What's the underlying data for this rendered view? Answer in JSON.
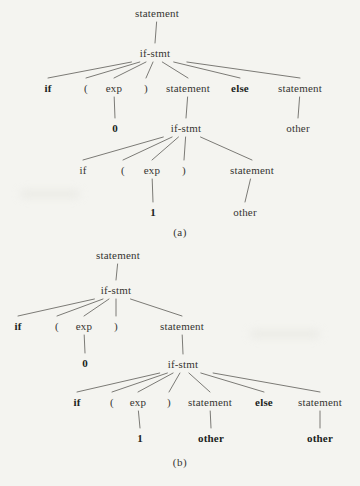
{
  "colors": {
    "background": "#f4f4f0",
    "text": "#363532",
    "bold_text": "#201f1d",
    "edge_line": "#6d6c68"
  },
  "tree_a": {
    "caption": "(a)",
    "caption_pos": {
      "x": 180,
      "y": 232
    },
    "nodes": [
      {
        "id": "statement-root",
        "label": "statement",
        "x": 157,
        "y": 13,
        "bold": false
      },
      {
        "id": "ifstmt-1",
        "label": "if-stmt",
        "x": 155,
        "y": 53,
        "bold": false
      },
      {
        "id": "if-1",
        "label": "if",
        "x": 48,
        "y": 88,
        "bold": true
      },
      {
        "id": "lparen-1",
        "label": "(",
        "x": 86,
        "y": 88,
        "bold": false
      },
      {
        "id": "exp-1",
        "label": "exp",
        "x": 114,
        "y": 88,
        "bold": false
      },
      {
        "id": "rparen-1",
        "label": ")",
        "x": 146,
        "y": 88,
        "bold": false
      },
      {
        "id": "statement-1",
        "label": "statement",
        "x": 188,
        "y": 88,
        "bold": false
      },
      {
        "id": "else-1",
        "label": "else",
        "x": 240,
        "y": 88,
        "bold": true
      },
      {
        "id": "statement-2",
        "label": "statement",
        "x": 300,
        "y": 88,
        "bold": false
      },
      {
        "id": "zero",
        "label": "0",
        "x": 115,
        "y": 128,
        "bold": true
      },
      {
        "id": "ifstmt-2",
        "label": "if-stmt",
        "x": 186,
        "y": 128,
        "bold": false
      },
      {
        "id": "other-1",
        "label": "other",
        "x": 298,
        "y": 128,
        "bold": false
      },
      {
        "id": "if-2",
        "label": "if",
        "x": 83,
        "y": 170,
        "bold": false
      },
      {
        "id": "lparen-2",
        "label": "(",
        "x": 123,
        "y": 170,
        "bold": false
      },
      {
        "id": "exp-2",
        "label": "exp",
        "x": 152,
        "y": 170,
        "bold": false
      },
      {
        "id": "rparen-2",
        "label": ")",
        "x": 184,
        "y": 170,
        "bold": false
      },
      {
        "id": "statement-3",
        "label": "statement",
        "x": 252,
        "y": 170,
        "bold": false
      },
      {
        "id": "one",
        "label": "1",
        "x": 153,
        "y": 212,
        "bold": true
      },
      {
        "id": "other-2",
        "label": "other",
        "x": 245,
        "y": 212,
        "bold": false
      }
    ],
    "edges": [
      [
        "statement-root",
        "ifstmt-1"
      ],
      [
        "ifstmt-1",
        "if-1"
      ],
      [
        "ifstmt-1",
        "lparen-1"
      ],
      [
        "ifstmt-1",
        "exp-1"
      ],
      [
        "ifstmt-1",
        "rparen-1"
      ],
      [
        "ifstmt-1",
        "statement-1"
      ],
      [
        "ifstmt-1",
        "else-1"
      ],
      [
        "ifstmt-1",
        "statement-2"
      ],
      [
        "exp-1",
        "zero"
      ],
      [
        "statement-1",
        "ifstmt-2"
      ],
      [
        "statement-2",
        "other-1"
      ],
      [
        "ifstmt-2",
        "if-2"
      ],
      [
        "ifstmt-2",
        "lparen-2"
      ],
      [
        "ifstmt-2",
        "exp-2"
      ],
      [
        "ifstmt-2",
        "rparen-2"
      ],
      [
        "ifstmt-2",
        "statement-3"
      ],
      [
        "exp-2",
        "one"
      ],
      [
        "statement-3",
        "other-2"
      ]
    ]
  },
  "tree_b": {
    "caption": "(b)",
    "caption_pos": {
      "x": 180,
      "y": 462
    },
    "nodes": [
      {
        "id": "statement-root",
        "label": "statement",
        "x": 118,
        "y": 255,
        "bold": false
      },
      {
        "id": "ifstmt-1",
        "label": "if-stmt",
        "x": 116,
        "y": 290,
        "bold": false
      },
      {
        "id": "if-1",
        "label": "if",
        "x": 18,
        "y": 326,
        "bold": true
      },
      {
        "id": "lparen-1",
        "label": "(",
        "x": 57,
        "y": 326,
        "bold": false
      },
      {
        "id": "exp-1",
        "label": "exp",
        "x": 84,
        "y": 326,
        "bold": false
      },
      {
        "id": "rparen-1",
        "label": ")",
        "x": 116,
        "y": 326,
        "bold": false
      },
      {
        "id": "statement-1",
        "label": "statement",
        "x": 182,
        "y": 326,
        "bold": false
      },
      {
        "id": "zero",
        "label": "0",
        "x": 85,
        "y": 363,
        "bold": true
      },
      {
        "id": "ifstmt-2",
        "label": "if-stmt",
        "x": 183,
        "y": 364,
        "bold": false
      },
      {
        "id": "if-2",
        "label": "if",
        "x": 77,
        "y": 402,
        "bold": true
      },
      {
        "id": "lparen-2",
        "label": "(",
        "x": 112,
        "y": 402,
        "bold": false
      },
      {
        "id": "exp-2",
        "label": "exp",
        "x": 138,
        "y": 402,
        "bold": false
      },
      {
        "id": "rparen-2",
        "label": ")",
        "x": 169,
        "y": 402,
        "bold": false
      },
      {
        "id": "statement-2",
        "label": "statement",
        "x": 210,
        "y": 402,
        "bold": false
      },
      {
        "id": "else-1",
        "label": "else",
        "x": 264,
        "y": 402,
        "bold": true
      },
      {
        "id": "statement-3",
        "label": "statement",
        "x": 320,
        "y": 402,
        "bold": false
      },
      {
        "id": "one",
        "label": "1",
        "x": 140,
        "y": 438,
        "bold": true
      },
      {
        "id": "other-1",
        "label": "other",
        "x": 211,
        "y": 438,
        "bold": true
      },
      {
        "id": "other-2",
        "label": "other",
        "x": 320,
        "y": 438,
        "bold": true
      }
    ],
    "edges": [
      [
        "statement-root",
        "ifstmt-1"
      ],
      [
        "ifstmt-1",
        "if-1"
      ],
      [
        "ifstmt-1",
        "lparen-1"
      ],
      [
        "ifstmt-1",
        "exp-1"
      ],
      [
        "ifstmt-1",
        "rparen-1"
      ],
      [
        "ifstmt-1",
        "statement-1"
      ],
      [
        "exp-1",
        "zero"
      ],
      [
        "statement-1",
        "ifstmt-2"
      ],
      [
        "ifstmt-2",
        "if-2"
      ],
      [
        "ifstmt-2",
        "lparen-2"
      ],
      [
        "ifstmt-2",
        "exp-2"
      ],
      [
        "ifstmt-2",
        "rparen-2"
      ],
      [
        "ifstmt-2",
        "statement-2"
      ],
      [
        "ifstmt-2",
        "else-1"
      ],
      [
        "ifstmt-2",
        "statement-3"
      ],
      [
        "exp-2",
        "one"
      ],
      [
        "statement-2",
        "other-1"
      ],
      [
        "statement-3",
        "other-2"
      ]
    ]
  }
}
